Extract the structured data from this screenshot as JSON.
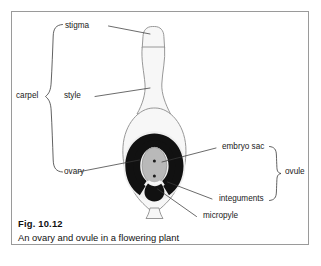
{
  "figure": {
    "caption_number": "Fig. 10.12",
    "caption_text": "An ovary and ovule in a flowering plant"
  },
  "labels": {
    "stigma": "stigma",
    "style": "style",
    "ovary": "ovary",
    "carpel": "carpel",
    "embryo_sac": "embryo sac",
    "integuments": "integuments",
    "micropyle": "micropyle",
    "ovule": "ovule"
  },
  "colors": {
    "frame_border": "#9a9a9a",
    "outline": "#8c8c8c",
    "carpel_fill": "#f7f7f7",
    "integument_fill": "#111111",
    "embryo_sac_fill": "#b9b9b9",
    "leader_line": "#3a3a3a",
    "text": "#1a1a1a",
    "background": "#ffffff"
  },
  "diagram": {
    "type": "labelled-biological-diagram",
    "parts": [
      {
        "name": "stigma",
        "side": "left",
        "group": "carpel"
      },
      {
        "name": "style",
        "side": "left",
        "group": "carpel"
      },
      {
        "name": "ovary",
        "side": "left",
        "group": "carpel"
      },
      {
        "name": "embryo sac",
        "side": "right",
        "group": "ovule"
      },
      {
        "name": "integuments",
        "side": "right",
        "group": "ovule"
      },
      {
        "name": "micropyle",
        "side": "right",
        "group": "ovule"
      }
    ],
    "braces": [
      {
        "label": "carpel",
        "side": "left",
        "spans": [
          "stigma",
          "style",
          "ovary"
        ]
      },
      {
        "label": "ovule",
        "side": "right",
        "spans": [
          "embryo sac",
          "integuments"
        ]
      }
    ]
  }
}
